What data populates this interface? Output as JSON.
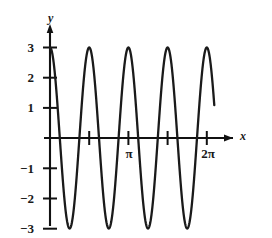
{
  "chart_data": {
    "type": "line",
    "title": "",
    "subtitle": "",
    "xlabel": "x",
    "ylabel": "y",
    "function": "y = 3 cos(4x)",
    "amplitude": 3,
    "period": "pi/2",
    "cycles_shown": 4,
    "xlim": [
      -0.12,
      6.85
    ],
    "ylim": [
      -3.45,
      3.45
    ],
    "grid": false,
    "legend": null,
    "legend_position": "none",
    "series": [
      {
        "name": "y = 3 cos(4x)",
        "color": "#1a1a1a",
        "x": [
          0,
          0.1963,
          0.3927,
          0.589,
          0.7854,
          0.9817,
          1.1781,
          1.3744,
          1.5708,
          1.7671,
          1.9635,
          2.1598,
          2.3562,
          2.5525,
          2.7489,
          2.9452,
          3.1416,
          3.3379,
          3.5343,
          3.7306,
          3.927,
          4.1233,
          4.3197,
          4.516,
          4.7124,
          4.9087,
          5.1051,
          5.3014,
          5.4978,
          5.6941,
          5.8905,
          6.0868,
          6.2832
        ],
        "y": [
          3,
          2.121,
          0,
          -2.121,
          -3,
          -2.121,
          0,
          2.121,
          3,
          2.121,
          0,
          -2.121,
          -3,
          -2.121,
          0,
          2.121,
          3,
          2.121,
          0,
          -2.121,
          -3,
          -2.121,
          0,
          2.121,
          3,
          2.121,
          0,
          -2.121,
          -3,
          -2.121,
          0,
          2.121,
          3
        ]
      }
    ],
    "x_ticks": [
      {
        "value": 1.5708,
        "label": ""
      },
      {
        "value": 3.1416,
        "label": "π"
      },
      {
        "value": 4.7124,
        "label": ""
      },
      {
        "value": 6.2832,
        "label": "2π"
      }
    ],
    "y_ticks": [
      {
        "value": 3,
        "label": "3"
      },
      {
        "value": 2,
        "label": "2"
      },
      {
        "value": 1,
        "label": "1"
      },
      {
        "value": -1,
        "label": "−1"
      },
      {
        "value": -2,
        "label": "−2"
      },
      {
        "value": -3,
        "label": "−3"
      }
    ],
    "axis_arrows": {
      "x": true,
      "y": true
    },
    "colors": {
      "curve": "#1a1a1a",
      "axis": "#111111",
      "background": "#ffffff",
      "text": "#1a1a1a"
    }
  }
}
